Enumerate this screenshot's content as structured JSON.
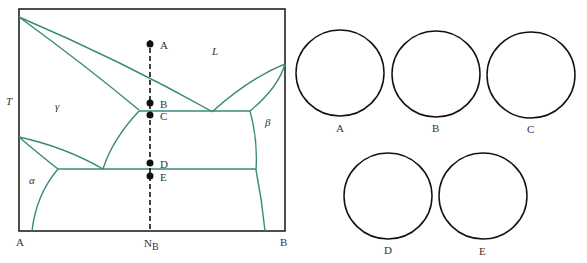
{
  "diagram": {
    "type": "binary-phase-diagram",
    "axis": {
      "y_label": "T",
      "x_left": "A",
      "x_right": "B",
      "x_marker": "N",
      "x_marker_sub": "B"
    },
    "phases": {
      "liquid": "L",
      "gamma": "γ",
      "beta": "β",
      "alpha": "α"
    },
    "points": [
      {
        "label": "A",
        "y": 44
      },
      {
        "label": "B",
        "y": 103
      },
      {
        "label": "C",
        "y": 115
      },
      {
        "label": "D",
        "y": 163
      },
      {
        "label": "E",
        "y": 176
      }
    ],
    "colors": {
      "boundary": "#3a8a78",
      "frame": "#222222",
      "marker": "#111111"
    }
  },
  "circles": [
    {
      "label": "A"
    },
    {
      "label": "B"
    },
    {
      "label": "C"
    },
    {
      "label": "D"
    },
    {
      "label": "E"
    }
  ]
}
